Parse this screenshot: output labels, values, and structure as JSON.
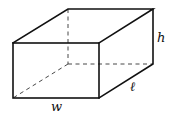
{
  "figure": {
    "type": "rectangular-box",
    "labels": {
      "width": "w",
      "length": "ℓ",
      "height": "h"
    },
    "colors": {
      "stroke": "#111111",
      "background": "#ffffff"
    }
  }
}
